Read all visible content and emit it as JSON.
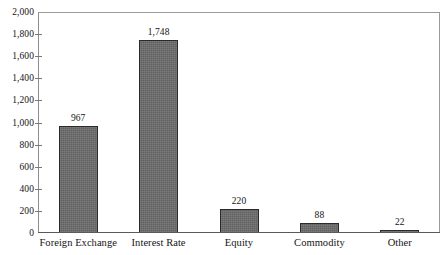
{
  "chart_data": {
    "type": "bar",
    "title": "",
    "subtitle": "",
    "xlabel": "",
    "ylabel": "",
    "categories": [
      "Foreign Exchange",
      "Interest Rate",
      "Equity",
      "Commodity",
      "Other"
    ],
    "values": [
      967,
      1748,
      220,
      88,
      22
    ],
    "value_labels": [
      "967",
      "1,748",
      "220",
      "88",
      "22"
    ],
    "ylim": [
      0,
      2000
    ],
    "ytick_step": 200,
    "ytick_labels": [
      "0",
      "200",
      "400",
      "600",
      "800",
      "1,000",
      "1,200",
      "1,400",
      "1,600",
      "1,800",
      "2,000"
    ],
    "ytick_values": [
      0,
      200,
      400,
      600,
      800,
      1000,
      1200,
      1400,
      1600,
      1800,
      2000
    ],
    "grid": false,
    "legend": false,
    "legend_position": "none",
    "bar_color": "#6b6b6b",
    "bar_border_color": "#2a2a2a",
    "frame_color": "#8d8d8d",
    "background_color": "#ffffff",
    "text_color": "#141414"
  }
}
